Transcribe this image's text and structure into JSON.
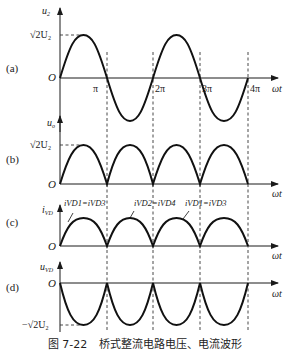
{
  "figure": {
    "caption_number": "图 7-22",
    "caption_title": "桥式整流电路电压、电流波形"
  },
  "axis": {
    "x_label": "ωt",
    "origin": "O",
    "ticks": [
      "π",
      "2π",
      "3π",
      "4π"
    ]
  },
  "panels": [
    {
      "id": "a",
      "tag": "(a)",
      "y_label_main": "u",
      "y_label_sub": "2",
      "peak_label": "√2U₂",
      "waveform": "sine",
      "description": "Input AC voltage u2, full sine over 0–4π"
    },
    {
      "id": "b",
      "tag": "(b)",
      "y_label_main": "u",
      "y_label_sub": "o",
      "peak_label": "√2U₂",
      "waveform": "full-wave rectified (positive half-sine arches)",
      "description": "Output voltage uo"
    },
    {
      "id": "c",
      "tag": "(c)",
      "y_label_main": "i",
      "y_label_sub": "VD",
      "waveform": "positive half-sine arches",
      "annotations": [
        "iVD1=iVD3",
        "iVD2=iVD4",
        "iVD1=iVD3"
      ],
      "description": "Diode currents"
    },
    {
      "id": "d",
      "tag": "(d)",
      "y_label_main": "u",
      "y_label_sub": "VD",
      "trough_label": "−√2U₂",
      "waveform": "negative half-sine arches",
      "description": "Diode reverse voltage uVD"
    }
  ]
}
